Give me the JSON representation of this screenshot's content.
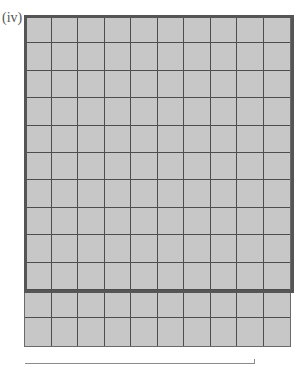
{
  "label": "(iv)",
  "grid": {
    "columns": 10,
    "rows": 12,
    "highlighted_block": {
      "columns": 10,
      "rows": 10,
      "total_squares": 100
    },
    "extra_rows": 2,
    "shaded_cells": "all",
    "fill_color": "#c7c7c7",
    "line_color": "#4d4d4d"
  },
  "answer_box": {
    "value": ""
  }
}
